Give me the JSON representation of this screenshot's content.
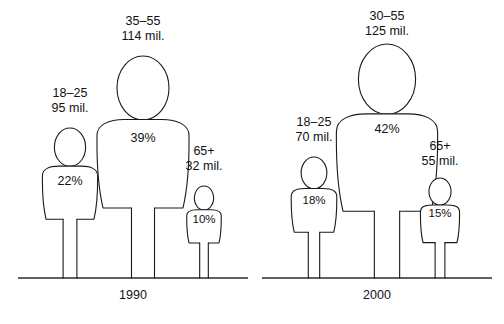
{
  "chart_data": {
    "type": "bar",
    "title": "",
    "subtitle": "",
    "xlabel": "",
    "ylabel": "",
    "legend_position": "none",
    "grid": false,
    "value_unit": "millions",
    "groups": [
      {
        "group_label": "1990",
        "baseline_y": 278,
        "baseline_x_start": 18,
        "baseline_x_end": 248,
        "label_x": 133,
        "label_y": 288,
        "bars": [
          {
            "age_range": "18–25",
            "population": "95 mil.",
            "population_value": 95,
            "percent": "22%",
            "percent_value": 22,
            "center_x": 70,
            "head_top_y": 128,
            "caption_x": 70,
            "caption_y": 86,
            "pct_x": 70,
            "pct_y": 182,
            "scale": 0.6
          },
          {
            "age_range": "35–55",
            "population": "114 mil.",
            "population_value": 114,
            "percent": "39%",
            "percent_value": 39,
            "center_x": 143,
            "head_top_y": 56,
            "caption_x": 143,
            "caption_y": 14,
            "pct_x": 143,
            "pct_y": 139,
            "scale": 1.0
          },
          {
            "age_range": "65+",
            "population": "32 mil.",
            "population_value": 32,
            "percent": "10%",
            "percent_value": 10,
            "center_x": 204,
            "head_top_y": 186,
            "caption_x": 204,
            "caption_y": 144,
            "pct_x": 204,
            "pct_y": 219,
            "scale": 0.375
          }
        ]
      },
      {
        "group_label": "2000",
        "baseline_y": 278,
        "baseline_x_start": 262,
        "baseline_x_end": 492,
        "label_x": 377,
        "label_y": 288,
        "bars": [
          {
            "age_range": "18–25",
            "population": "70 mil.",
            "population_value": 70,
            "percent": "18%",
            "percent_value": 18,
            "center_x": 314,
            "head_top_y": 157,
            "caption_x": 314,
            "caption_y": 115,
            "pct_x": 314,
            "pct_y": 200,
            "scale": 0.495
          },
          {
            "age_range": "30–55",
            "population": "125 mil.",
            "population_value": 125,
            "percent": "42%",
            "percent_value": 42,
            "center_x": 387,
            "head_top_y": 44,
            "caption_x": 387,
            "caption_y": 9,
            "pct_x": 387,
            "pct_y": 130,
            "scale": 1.1
          },
          {
            "age_range": "65+",
            "population": "55 mil.",
            "population_value": 55,
            "percent": "15%",
            "percent_value": 15,
            "center_x": 440,
            "head_top_y": 178,
            "caption_x": 440,
            "caption_y": 139,
            "pct_x": 440,
            "pct_y": 213,
            "scale": 0.425
          }
        ]
      }
    ],
    "colors": {
      "background": "#ffffff",
      "outline": "#1a1a1a",
      "baseline": "#2b2b2b",
      "text": "#111111"
    }
  }
}
